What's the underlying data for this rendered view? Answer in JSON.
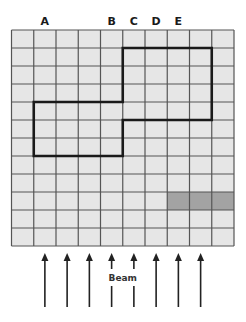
{
  "diagram": {
    "title": "",
    "grid": {
      "columns": 10,
      "rows": 12,
      "cell_fill": "#e6e6e6",
      "line_color": "#555555"
    },
    "column_labels": [
      {
        "text": "A",
        "column": 1
      },
      {
        "text": "B",
        "column": 4
      },
      {
        "text": "C",
        "column": 5
      },
      {
        "text": "D",
        "column": 6
      },
      {
        "text": "E",
        "column": 7
      }
    ],
    "outline": {
      "description": "thick boundary polygon in grid (column,row) units",
      "color": "#1a1a1a",
      "vertices": [
        [
          5,
          1
        ],
        [
          9,
          1
        ],
        [
          9,
          5
        ],
        [
          5,
          5
        ],
        [
          5,
          7
        ],
        [
          1,
          7
        ],
        [
          1,
          4
        ],
        [
          5,
          4
        ]
      ]
    },
    "shaded_cells": {
      "color": "#a3a3a3",
      "cells": [
        {
          "row": 9,
          "column": 7
        },
        {
          "row": 9,
          "column": 8
        },
        {
          "row": 9,
          "column": 9
        }
      ]
    },
    "beam": {
      "label": "Beam",
      "direction": "up",
      "arrow_columns": [
        1,
        2,
        3,
        4,
        5,
        6,
        7,
        8
      ],
      "label_between_columns": [
        4,
        5
      ],
      "color": "#222222"
    }
  }
}
